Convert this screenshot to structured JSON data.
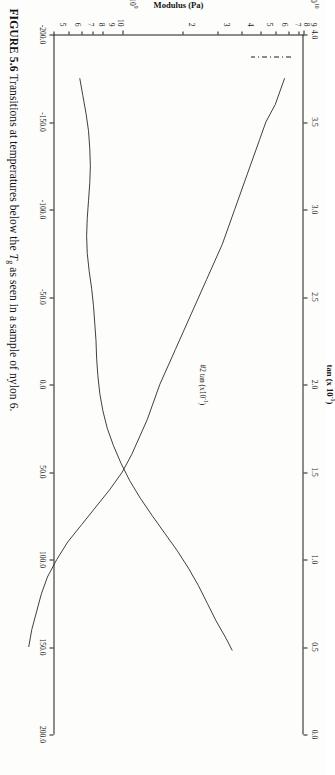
{
  "caption": {
    "figure_number": "FIGURE 5.6",
    "text_before_tg": "Transitions at temperatures below the ",
    "tg_symbol": "T",
    "tg_subscript": "g",
    "text_after_tg": " as seen in a sample of nylon 6."
  },
  "chart_data": {
    "type": "line",
    "title": "",
    "xlabel": "",
    "ylabel": "Modulus (Pa)",
    "y2label": "tan",
    "y2label_multiplier": "(x 10",
    "y2label_exponent": "-1",
    "y2label_close": ")",
    "series_annotation": "#2  tan  (x10",
    "series_annotation_exp": "-1",
    "series_annotation_close": ")",
    "x_axis": {
      "name": "Temperature",
      "ticks": [
        -200.0,
        -150.0,
        -100.0,
        -50.0,
        0.0,
        50.0,
        100.0,
        150.0,
        200.0
      ],
      "tick_labels": [
        "-200.0",
        "-150.0",
        "-100.0",
        "-50.0",
        "0.0",
        "50.0",
        "100.0",
        "150.0",
        "200.0"
      ],
      "range": [
        -200.0,
        200.0
      ]
    },
    "y_axis_left": {
      "name": "Modulus (Pa)",
      "scale": "log",
      "range": [
        500000000.0,
        20000000000.0
      ],
      "decade_labels": [
        {
          "value": 1000000000.0,
          "mantissa": "10",
          "exponent": "9"
        },
        {
          "value": 10000000000.0,
          "mantissa": "10",
          "exponent": "10"
        }
      ],
      "minor_labels": [
        "5",
        "6",
        "7",
        "8",
        "9",
        "10",
        "2",
        "3",
        "4",
        "5",
        "6",
        "7",
        "8",
        "9",
        "10",
        "2"
      ]
    },
    "y_axis_right": {
      "name": "tan delta (x 10^-1)",
      "ticks": [
        0.0,
        0.5,
        1.0,
        1.5,
        2.0,
        2.5,
        3.0,
        3.5,
        4.0
      ],
      "tick_labels": [
        "0.0",
        "0.5",
        "1.0",
        "1.5",
        "2.0",
        "2.5",
        "3.0",
        "3.5",
        "4.0"
      ],
      "range": [
        0.0,
        4.0
      ]
    },
    "series": [
      {
        "name": "Modulus",
        "axis": "left",
        "style": "solid",
        "x": [
          -175,
          -170,
          -160,
          -150,
          -140,
          -130,
          -120,
          -110,
          -100,
          -90,
          -80,
          -70,
          -60,
          -50,
          -40,
          -30,
          -20,
          -10,
          0,
          10,
          20,
          30,
          40,
          50,
          60,
          70,
          80,
          90,
          100,
          110,
          120,
          130,
          140,
          150
        ],
        "y_log_pa": [
          10.18,
          10.16,
          10.12,
          10.06,
          10.02,
          9.98,
          9.94,
          9.9,
          9.86,
          9.82,
          9.78,
          9.73,
          9.68,
          9.63,
          9.58,
          9.53,
          9.48,
          9.43,
          9.38,
          9.34,
          9.3,
          9.25,
          9.2,
          9.14,
          9.06,
          8.97,
          8.88,
          8.79,
          8.72,
          8.66,
          8.62,
          8.59,
          8.56,
          8.54
        ]
      },
      {
        "name": "tan delta #2",
        "axis": "right",
        "style": "solid",
        "x": [
          -175,
          -165,
          -155,
          -145,
          -135,
          -125,
          -115,
          -105,
          -95,
          -85,
          -75,
          -65,
          -55,
          -45,
          -35,
          -25,
          -15,
          -5,
          5,
          15,
          25,
          35,
          45,
          55,
          65,
          75,
          85,
          95,
          105,
          115,
          125,
          135,
          145,
          152
        ],
        "y_tan": [
          0.42,
          0.47,
          0.52,
          0.56,
          0.58,
          0.59,
          0.58,
          0.56,
          0.54,
          0.53,
          0.54,
          0.57,
          0.61,
          0.64,
          0.66,
          0.68,
          0.69,
          0.71,
          0.74,
          0.79,
          0.86,
          0.96,
          1.08,
          1.22,
          1.39,
          1.58,
          1.78,
          1.98,
          2.16,
          2.32,
          2.46,
          2.6,
          2.76,
          2.86
        ]
      }
    ],
    "legend": {
      "position": "top-left-inside",
      "dashed_marker": true
    }
  }
}
